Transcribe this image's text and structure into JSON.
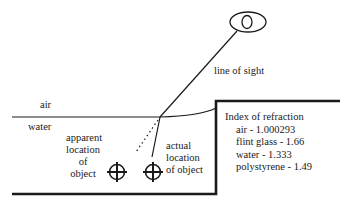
{
  "diagram": {
    "labels": {
      "line_of_sight": "line of sight",
      "air": "air",
      "water": "water",
      "apparent_location": [
        "apparent",
        "location",
        "of",
        "object"
      ],
      "actual_location": [
        "actual",
        "location",
        "of object"
      ]
    },
    "legend": {
      "title": "Index of refraction",
      "items": [
        {
          "label": "air - 1.000293",
          "material": "air",
          "value": 1.000293
        },
        {
          "label": "flint glass - 1.66",
          "material": "flint glass",
          "value": 1.66
        },
        {
          "label": "water - 1.333",
          "material": "water",
          "value": 1.333
        },
        {
          "label": "polystyrene - 1.49",
          "material": "polystyrene",
          "value": 1.49
        }
      ]
    },
    "icons": {
      "eye": "eye-icon",
      "apparent_object": "crosshair-circle-icon",
      "actual_object": "crosshair-circle-icon"
    },
    "colors": {
      "stroke": "#1a1a1a",
      "background": "#ffffff"
    }
  }
}
